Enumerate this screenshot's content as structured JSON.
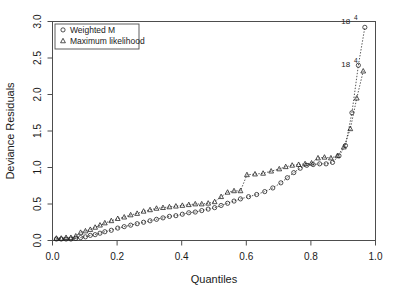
{
  "chart_data": {
    "type": "scatter",
    "title": "",
    "xlabel": "Quantiles",
    "ylabel": "Deviance Residuals",
    "xlim": [
      0.0,
      1.0
    ],
    "ylim": [
      0.0,
      3.0
    ],
    "xticks": [
      "0.0",
      "0.2",
      "0.4",
      "0.6",
      "0.8",
      "1.0"
    ],
    "xtick_values": [
      0.0,
      0.2,
      0.4,
      0.6,
      0.8,
      1.0
    ],
    "yticks": [
      "0.0",
      "0.5",
      "1.0",
      "1.5",
      "2.0",
      "2.5",
      "3.0"
    ],
    "ytick_values": [
      0.0,
      0.5,
      1.0,
      1.5,
      2.0,
      2.5,
      3.0
    ],
    "grid": false,
    "legend_position": "top-left",
    "series": [
      {
        "name": "Weighted M",
        "marker": "circle",
        "color": "#1a1a1a",
        "linestyle": "dotted",
        "x": [
          0.012,
          0.027,
          0.042,
          0.057,
          0.072,
          0.087,
          0.102,
          0.117,
          0.132,
          0.147,
          0.162,
          0.182,
          0.202,
          0.222,
          0.242,
          0.262,
          0.282,
          0.302,
          0.322,
          0.342,
          0.362,
          0.382,
          0.402,
          0.422,
          0.442,
          0.462,
          0.482,
          0.502,
          0.522,
          0.542,
          0.562,
          0.582,
          0.607,
          0.632,
          0.657,
          0.682,
          0.707,
          0.727,
          0.747,
          0.767,
          0.787,
          0.807,
          0.827,
          0.847,
          0.867,
          0.887,
          0.907,
          0.927,
          0.947,
          0.967
        ],
        "y": [
          0.02,
          0.02,
          0.02,
          0.02,
          0.03,
          0.04,
          0.05,
          0.07,
          0.08,
          0.1,
          0.12,
          0.14,
          0.17,
          0.19,
          0.21,
          0.23,
          0.25,
          0.27,
          0.29,
          0.31,
          0.33,
          0.34,
          0.36,
          0.38,
          0.39,
          0.41,
          0.43,
          0.45,
          0.48,
          0.51,
          0.54,
          0.57,
          0.6,
          0.63,
          0.67,
          0.72,
          0.79,
          0.86,
          0.93,
          0.99,
          1.03,
          1.04,
          1.05,
          1.05,
          1.07,
          1.16,
          1.3,
          1.75,
          2.4,
          2.92
        ]
      },
      {
        "name": "Maximum likelihood",
        "marker": "triangle",
        "color": "#1a1a1a",
        "linestyle": "dotted",
        "x": [
          0.012,
          0.027,
          0.042,
          0.057,
          0.072,
          0.087,
          0.102,
          0.117,
          0.132,
          0.147,
          0.162,
          0.182,
          0.202,
          0.222,
          0.242,
          0.262,
          0.282,
          0.302,
          0.322,
          0.342,
          0.362,
          0.382,
          0.402,
          0.422,
          0.442,
          0.462,
          0.482,
          0.502,
          0.522,
          0.542,
          0.562,
          0.582,
          0.602,
          0.627,
          0.652,
          0.677,
          0.702,
          0.722,
          0.742,
          0.762,
          0.782,
          0.802,
          0.822,
          0.842,
          0.862,
          0.882,
          0.902,
          0.922,
          0.942,
          0.962
        ],
        "y": [
          0.03,
          0.03,
          0.04,
          0.04,
          0.06,
          0.11,
          0.13,
          0.15,
          0.18,
          0.21,
          0.24,
          0.27,
          0.3,
          0.32,
          0.35,
          0.37,
          0.4,
          0.42,
          0.44,
          0.45,
          0.46,
          0.47,
          0.48,
          0.49,
          0.5,
          0.5,
          0.51,
          0.53,
          0.6,
          0.66,
          0.68,
          0.68,
          0.9,
          0.91,
          0.92,
          0.95,
          0.98,
          1.01,
          1.03,
          1.04,
          1.05,
          1.06,
          1.13,
          1.14,
          1.13,
          1.16,
          1.28,
          1.53,
          1.95,
          2.32
        ]
      }
    ],
    "annotations": [
      {
        "text": "18",
        "sup": "4",
        "x": 0.945,
        "y": 2.97,
        "series": "Weighted M"
      },
      {
        "text": "18",
        "sup": "4",
        "x": 0.945,
        "y": 2.38,
        "series": "Maximum likelihood"
      }
    ]
  },
  "legend": {
    "entries": [
      {
        "label": "Weighted M",
        "marker": "circle"
      },
      {
        "label": "Maximum likelihood",
        "marker": "triangle"
      }
    ]
  }
}
